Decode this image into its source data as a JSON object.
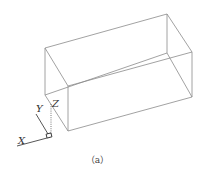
{
  "figure": {
    "caption": "（a）",
    "axes": {
      "x_label": "X",
      "y_label": "Y",
      "z_label": "Z"
    },
    "box": {
      "vertices": {
        "back_top_left": [
          45,
          48
        ],
        "back_top_right": [
          167,
          14
        ],
        "back_bottom_left": [
          45,
          95
        ],
        "back_bottom_right": [
          167,
          53
        ],
        "front_top_left": [
          68,
          86
        ],
        "front_top_right": [
          192,
          52
        ],
        "front_bottom_left": [
          68,
          131
        ],
        "front_bottom_right": [
          192,
          97
        ]
      }
    },
    "colors": {
      "edge": "#8a8a8a",
      "axis": "#444444"
    }
  }
}
